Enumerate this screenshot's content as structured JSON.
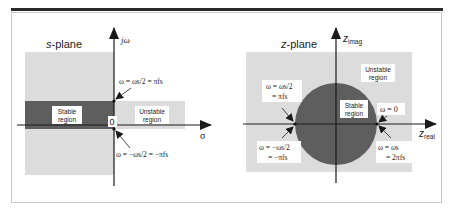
{
  "colors": {
    "unstable_fill": "#dcdcdc",
    "stable_fill": "#5e5e5e",
    "axis": "#1a1a1a",
    "label_box": "#ffffff",
    "top_rule": "#2a2a2a"
  },
  "s_plane": {
    "title_italic": "s",
    "title_rest": "-plane",
    "vertical_axis": "jω",
    "horizontal_axis": "σ",
    "origin": "0",
    "stable_region": [
      "Stable",
      "region"
    ],
    "unstable_region": [
      "Unstable",
      "region"
    ],
    "upper_annotation": "ω = ωs/2 = πfs",
    "lower_annotation": "ω = −ωs/2 = −πfs"
  },
  "z_plane": {
    "title_italic": "z",
    "title_rest": "-plane",
    "vertical_axis_base": "z",
    "vertical_axis_sub": "imag",
    "horizontal_axis_base": "z",
    "horizontal_axis_sub": "real",
    "stable_region": [
      "Stable",
      "region"
    ],
    "unstable_region": [
      "Unstable",
      "region"
    ],
    "upper_left_annotation": [
      "ω = ωs/2",
      "= πfs"
    ],
    "lower_left_annotation": [
      "ω = −ωs/2",
      "= −πfs"
    ],
    "right_upper_annotation": "ω = 0",
    "right_lower_annotation": [
      "ω = ωs",
      "= 2πfs"
    ]
  }
}
